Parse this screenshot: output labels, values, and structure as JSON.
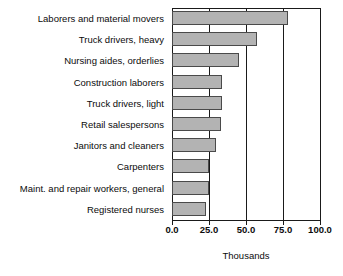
{
  "chart_data": {
    "type": "bar",
    "orientation": "horizontal",
    "title": "",
    "xlabel": "Thousands",
    "ylabel": "",
    "xlim": [
      0,
      100
    ],
    "xticks": [
      "0.0",
      "25.0",
      "50.0",
      "75.0",
      "100.0"
    ],
    "xtick_values": [
      0,
      25,
      50,
      75,
      100
    ],
    "grid": true,
    "grid_axis": "x",
    "legend": false,
    "bar_fill_color": "#b3b3b3",
    "bar_edge_color": "#4a4a4a",
    "axis_color": "#1a1a1a",
    "background_color": "#ffffff",
    "categories": [
      "Laborers and material movers",
      "Truck drivers, heavy",
      "Nursing aides, orderlies",
      "Construction laborers",
      "Truck drivers, light",
      "Retail salespersons",
      "Janitors and cleaners",
      "Carpenters",
      "Maint. and repair workers, general",
      "Registered nurses"
    ],
    "values": [
      78.5,
      57.5,
      45.0,
      34.0,
      33.5,
      33.0,
      30.0,
      25.0,
      25.0,
      23.0
    ]
  }
}
